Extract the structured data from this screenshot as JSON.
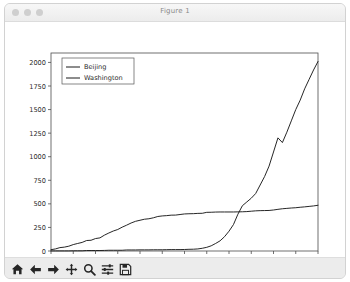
{
  "window": {
    "title": "Figure 1",
    "traffic_lights": [
      "close-button",
      "minimize-button",
      "maximize-button"
    ]
  },
  "toolbar": {
    "buttons": [
      {
        "name": "home-button",
        "label": "Home",
        "icon": "home-icon"
      },
      {
        "name": "back-button",
        "label": "Back",
        "icon": "arrow-left-icon"
      },
      {
        "name": "forward-button",
        "label": "Forward",
        "icon": "arrow-right-icon"
      },
      {
        "name": "pan-button",
        "label": "Pan",
        "icon": "move-cross-icon"
      },
      {
        "name": "zoom-button",
        "label": "Zoom",
        "icon": "magnifier-icon"
      },
      {
        "name": "subplots-button",
        "label": "Configure subplots",
        "icon": "sliders-icon"
      },
      {
        "name": "save-button",
        "label": "Save",
        "icon": "floppy-disk-icon"
      }
    ]
  },
  "chart_data": {
    "type": "line",
    "title": "",
    "xlabel": "",
    "ylabel": "",
    "grid": false,
    "legend_position": "upper left",
    "ylim": [
      0,
      2100
    ],
    "yticks": [
      0,
      250,
      500,
      750,
      1000,
      1250,
      1500,
      1750,
      2000
    ],
    "ytick_labels": [
      "0",
      "250",
      "500",
      "750",
      "1000",
      "1250",
      "1500",
      "1750",
      "2000"
    ],
    "xticks": [
      0,
      5,
      10,
      15,
      20,
      25,
      30,
      35,
      40,
      45,
      50,
      55,
      60
    ],
    "xtick_labels": [
      "01.22",
      "01.27",
      "02.01",
      "02.06",
      "02.11",
      "02.16",
      "02.21",
      "02.26",
      "03.02",
      "03.07",
      "03.12",
      "03.17",
      "03.22"
    ],
    "x": [
      0,
      1,
      2,
      3,
      4,
      5,
      6,
      7,
      8,
      9,
      10,
      11,
      12,
      13,
      14,
      15,
      16,
      17,
      18,
      19,
      20,
      21,
      22,
      23,
      24,
      25,
      26,
      27,
      28,
      29,
      30,
      31,
      32,
      33,
      34,
      35,
      36,
      37,
      38,
      39,
      40,
      41,
      42,
      43,
      44,
      45,
      46,
      47,
      48,
      49,
      50,
      51,
      52,
      53,
      54,
      55,
      56,
      57,
      58,
      59,
      60
    ],
    "series": [
      {
        "name": "Beijing",
        "color": "#1a1a1a",
        "values": [
          14,
          22,
          36,
          41,
          51,
          68,
          80,
          91,
          111,
          114,
          132,
          139,
          168,
          191,
          212,
          228,
          253,
          274,
          297,
          315,
          326,
          337,
          342,
          352,
          366,
          372,
          375,
          380,
          381,
          387,
          393,
          395,
          396,
          399,
          400,
          410,
          411,
          413,
          414,
          414,
          414,
          414,
          415,
          416,
          418,
          422,
          426,
          428,
          429,
          430,
          435,
          442,
          448,
          452,
          456,
          459,
          464,
          468,
          473,
          478,
          485
        ],
        "final_value": 485
      },
      {
        "name": "Washington",
        "color": "#1a1a1a",
        "values": [
          1,
          1,
          1,
          1,
          1,
          2,
          2,
          2,
          5,
          5,
          5,
          5,
          6,
          8,
          8,
          8,
          8,
          11,
          11,
          11,
          12,
          12,
          12,
          13,
          13,
          13,
          14,
          15,
          15,
          15,
          16,
          18,
          19,
          22,
          29,
          39,
          55,
          80,
          108,
          152,
          210,
          280,
          390,
          480,
          520,
          560,
          610,
          700,
          790,
          900,
          1050,
          1200,
          1150,
          1260,
          1380,
          1500,
          1600,
          1720,
          1820,
          1920,
          2010
        ],
        "final_value": 2010
      }
    ],
    "legend": [
      {
        "label": "Beijing",
        "color": "#1a1a1a"
      },
      {
        "label": "Washington",
        "color": "#1a1a1a"
      }
    ]
  }
}
